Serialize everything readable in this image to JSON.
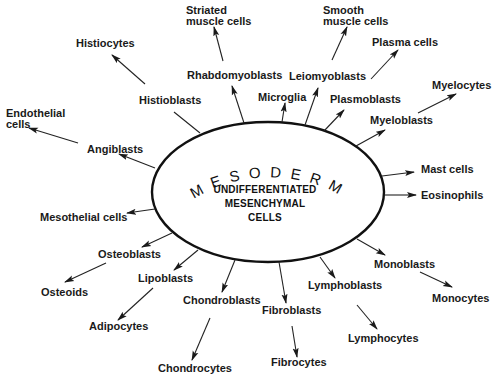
{
  "diagram": {
    "ring_label": "MESODERM",
    "center_lines": [
      "UNDIFFERENTIATED",
      "MESENCHYMAL",
      "CELLS"
    ],
    "colors": {
      "ink": "#1a1a1a",
      "background": "#ffffff"
    },
    "nodes": {
      "striated_muscle_cells": [
        "Striated",
        "muscle cells"
      ],
      "smooth_muscle_cells": [
        "Smooth",
        "muscle cells"
      ],
      "histiocytes": "Histiocytes",
      "rhabdomyoblasts": "Rhabdomyoblasts",
      "leiomyoblasts": "Leiomyoblasts",
      "plasma_cells": "Plasma cells",
      "myelocytes": "Myelocytes",
      "endothelial_cells": [
        "Endothelial",
        "cells"
      ],
      "histioblasts": "Histioblasts",
      "microglia": "Microglia",
      "plasmoblasts": "Plasmoblasts",
      "myeloblasts": "Myeloblasts",
      "angiblasts": "Angiblasts",
      "mast_cells": "Mast cells",
      "eosinophils": "Eosinophils",
      "mesothelial_cells": "Mesothelial cells",
      "osteoblasts": "Osteoblasts",
      "osteoids": "Osteoids",
      "lipoblasts": "Lipoblasts",
      "adipocytes": "Adipocytes",
      "chondroblasts": "Chondroblasts",
      "chondrocytes": "Chondrocytes",
      "fibroblasts": "Fibroblasts",
      "fibrocytes": "Fibrocytes",
      "lymphoblasts": "Lymphoblasts",
      "lymphocytes": "Lymphocytes",
      "monoblasts": "Monoblasts",
      "monocytes": "Monocytes"
    },
    "edges": [
      [
        "mesenchymal",
        "rhabdomyoblasts"
      ],
      [
        "rhabdomyoblasts",
        "striated_muscle_cells"
      ],
      [
        "mesenchymal",
        "histioblasts"
      ],
      [
        "histioblasts",
        "histiocytes"
      ],
      [
        "mesenchymal",
        "angiblasts"
      ],
      [
        "angiblasts",
        "endothelial_cells"
      ],
      [
        "mesenchymal",
        "microglia"
      ],
      [
        "mesenchymal",
        "leiomyoblasts"
      ],
      [
        "leiomyoblasts",
        "smooth_muscle_cells"
      ],
      [
        "mesenchymal",
        "plasmoblasts"
      ],
      [
        "plasmoblasts",
        "plasma_cells"
      ],
      [
        "mesenchymal",
        "myeloblasts"
      ],
      [
        "myeloblasts",
        "myelocytes"
      ],
      [
        "mesenchymal",
        "mast_cells"
      ],
      [
        "mesenchymal",
        "eosinophils"
      ],
      [
        "mesenchymal",
        "mesothelial_cells"
      ],
      [
        "mesenchymal",
        "osteoblasts"
      ],
      [
        "osteoblasts",
        "osteoids"
      ],
      [
        "mesenchymal",
        "lipoblasts"
      ],
      [
        "lipoblasts",
        "adipocytes"
      ],
      [
        "mesenchymal",
        "chondroblasts"
      ],
      [
        "chondroblasts",
        "chondrocytes"
      ],
      [
        "mesenchymal",
        "fibroblasts"
      ],
      [
        "fibroblasts",
        "fibrocytes"
      ],
      [
        "mesenchymal",
        "lymphoblasts"
      ],
      [
        "lymphoblasts",
        "lymphocytes"
      ],
      [
        "mesenchymal",
        "monoblasts"
      ],
      [
        "monoblasts",
        "monocytes"
      ]
    ]
  }
}
